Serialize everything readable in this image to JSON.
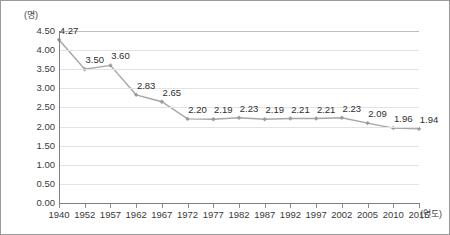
{
  "chart_data": {
    "type": "line",
    "title": "",
    "xlabel": "(연도)",
    "ylabel": "(명)",
    "categories": [
      "1940",
      "1952",
      "1957",
      "1962",
      "1967",
      "1972",
      "1977",
      "1982",
      "1987",
      "1992",
      "1997",
      "2002",
      "2005",
      "2010",
      "2015"
    ],
    "values": [
      4.27,
      3.5,
      3.6,
      2.83,
      2.65,
      2.2,
      2.19,
      2.23,
      2.19,
      2.21,
      2.21,
      2.23,
      2.09,
      1.96,
      1.94
    ],
    "value_labels": [
      "4.27",
      "3.50",
      "3.60",
      "2.83",
      "2.65",
      "2.20",
      "2.19",
      "2.23",
      "2.19",
      "2.21",
      "2.21",
      "2.23",
      "2.09",
      "1.96",
      "1.94"
    ],
    "ylim": [
      0.0,
      4.5
    ],
    "ytick_labels": [
      "4.50",
      "4.00",
      "3.50",
      "3.00",
      "2.50",
      "2.00",
      "1.50",
      "1.00",
      "0.50",
      "0.00"
    ],
    "ytick_values": [
      4.5,
      4.0,
      3.5,
      3.0,
      2.5,
      2.0,
      1.5,
      1.0,
      0.5,
      0.0
    ],
    "grid": true,
    "legend": "none",
    "series_color": "#a6a6aa",
    "marker_color": "#9a9a9e",
    "grid_color": "#e3e3e5",
    "axis_color": "#808084"
  }
}
